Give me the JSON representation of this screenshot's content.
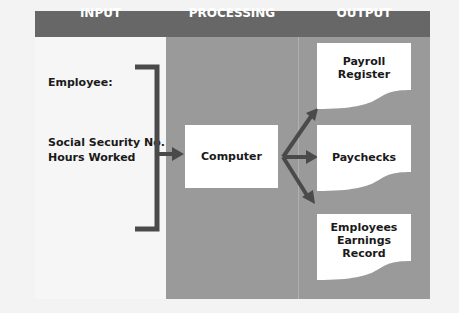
{
  "header": {
    "columns": [
      "INPUT",
      "PROCESSING",
      "OUTPUT"
    ],
    "color": "#676767"
  },
  "input": {
    "employee_label": "Employee:",
    "fields": [
      "Social Security No.",
      "Hours Worked"
    ]
  },
  "processing": {
    "box_label": "Computer"
  },
  "output": {
    "documents": [
      {
        "lines": [
          "Payroll",
          "Register"
        ]
      },
      {
        "lines": [
          "Paychecks"
        ]
      },
      {
        "lines": [
          "Employees",
          "Earnings",
          "Record"
        ]
      }
    ]
  },
  "colors": {
    "column_fill": "#9a9a9a",
    "arrow": "#4a4a4a",
    "box": "#ffffff"
  }
}
